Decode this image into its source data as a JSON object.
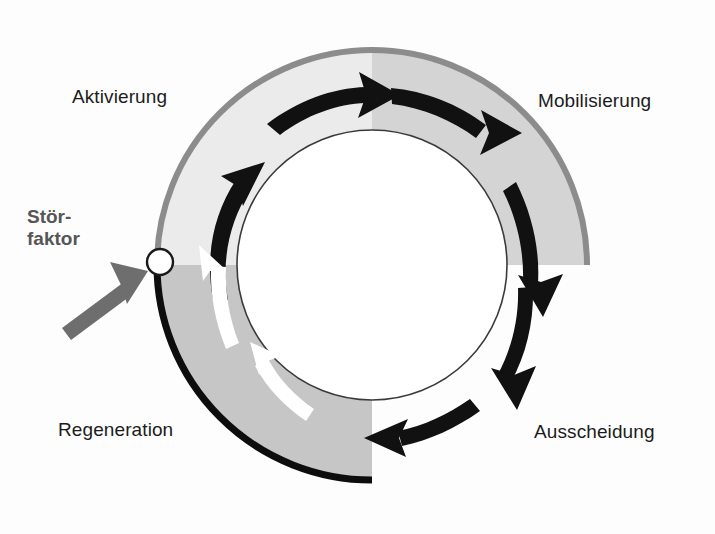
{
  "figure": {
    "kind": "cycle-diagram",
    "background_color": "#fdfdfd",
    "center": {
      "x": 372,
      "y": 265
    },
    "outer_radius": 215,
    "inner_radius": 135
  },
  "segments": [
    {
      "id": "aktivierung",
      "label": "Aktivierung",
      "order": 1,
      "start_angle_deg": 270,
      "end_angle_deg": 360,
      "quadrant": "top-left",
      "fill_color": "#ebebeb",
      "outer_stroke_color": "#8c8c8c",
      "outer_stroke_width": 6,
      "arrow_color": "#111111",
      "arrow_count": 2,
      "label_position": "outside-top-left"
    },
    {
      "id": "mobilisierung",
      "label": "Mobilisierung",
      "order": 2,
      "start_angle_deg": 0,
      "end_angle_deg": 90,
      "quadrant": "top-right",
      "fill_color": "#d4d4d4",
      "outer_stroke_color": "#8c8c8c",
      "outer_stroke_width": 6,
      "arrow_color": "#111111",
      "arrow_count": 2,
      "label_position": "outside-top-right"
    },
    {
      "id": "ausscheidung",
      "label": "Ausscheidung",
      "order": 3,
      "start_angle_deg": 90,
      "end_angle_deg": 180,
      "quadrant": "bottom-right",
      "fill_color": "none",
      "outer_stroke_color": "none",
      "outer_stroke_width": 0,
      "arrow_color": "#111111",
      "arrow_count": 2,
      "label_position": "outside-bottom-right"
    },
    {
      "id": "regeneration",
      "label": "Regeneration",
      "order": 4,
      "start_angle_deg": 180,
      "end_angle_deg": 270,
      "quadrant": "bottom-left",
      "fill_color": "#c6c6c6",
      "outer_stroke_color": "#0d0d0d",
      "outer_stroke_width": 7,
      "arrow_color": "#ffffff",
      "arrow_count": 2,
      "label_position": "outside-bottom-left"
    }
  ],
  "inner_circle": {
    "fill_color": "#ffffff",
    "stroke_color": "#3a3a3a",
    "stroke_width": 1.6
  },
  "stoerfaktor": {
    "label_line_1": "Stör-",
    "label_line_2": "faktor",
    "text_color": "#565656",
    "marker": {
      "shape": "circle",
      "fill_color": "#ffffff",
      "stroke_color": "#1a1a1a",
      "radius": 13,
      "position_angle_deg": 180,
      "cx": 160,
      "cy": 262
    },
    "pointer_arrow": {
      "color": "#6e6e6e",
      "direction": "up-right",
      "from": {
        "x": 64,
        "y": 332
      },
      "to": {
        "x": 141,
        "y": 274
      }
    }
  },
  "label_text_color": "#1c1c1c"
}
